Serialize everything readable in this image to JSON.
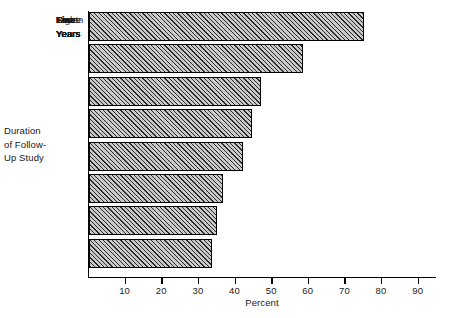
{
  "chart_data": {
    "type": "bar",
    "orientation": "horizontal",
    "title": "",
    "xlabel": "Percent",
    "ylabel": "Duration of Follow-Up Study",
    "ylabel_lines": [
      "Duration",
      "of Follow-",
      "Up Study"
    ],
    "categories": [
      "One Year",
      "Two Years",
      "Three Years",
      "Four Years",
      "Five Years",
      "Six Years",
      "Seven Years",
      "Eight Years"
    ],
    "category_lines": [
      [
        "One",
        "Year"
      ],
      [
        "Two",
        "Years"
      ],
      [
        "Three",
        "Years"
      ],
      [
        "Four",
        "Years"
      ],
      [
        "Five",
        "Years"
      ],
      [
        "Six",
        "Years"
      ],
      [
        "Seven",
        "Years"
      ],
      [
        "Eight",
        "Years"
      ]
    ],
    "values": [
      75,
      58.5,
      47,
      44.5,
      42,
      36.5,
      35,
      33.5
    ],
    "xlim": [
      0,
      95
    ],
    "xticks": [
      10,
      20,
      30,
      40,
      50,
      60,
      70,
      80,
      90
    ],
    "xtick_labels": [
      "10",
      "20",
      "30",
      "40",
      "50",
      "60",
      "70",
      "80",
      "90"
    ],
    "grid": false,
    "legend": null,
    "bar_style": {
      "fill": "#c9c9c9",
      "hatch": "diagonal-45",
      "hatch_color": "#2b2b2b",
      "edge_color": "#000000"
    },
    "axis_color": "#000000",
    "background": "#ffffff"
  }
}
